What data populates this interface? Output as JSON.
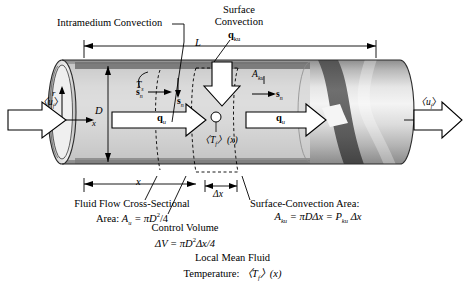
{
  "figure": {
    "colors": {
      "ink": "#000000",
      "tube_light": "#e9e9e9",
      "tube_mid": "#c8c8c8",
      "tube_dark": "#9a9a9a",
      "band_dark": "#6b6b6b",
      "band_light": "#f2f2f2",
      "rim": "#8f8f8f",
      "white": "#ffffff"
    },
    "annotations": {
      "intramedium_convection": "Intramedium Convection",
      "surface_convection_line1": "Surface",
      "surface_convection_line2": "Convection",
      "q_ku": "q",
      "q_ku_sub": "ku",
      "q_u": "q",
      "q_u_sub": "u",
      "s_n": "s",
      "s_n_sub": "n",
      "T_s": "T",
      "T_s_sub": "s",
      "A_ku": "A",
      "A_ku_sub": "ku",
      "length_L": "L",
      "diameter_D": "D",
      "axis_x": "x",
      "axis_r": "r",
      "dist_x": "x",
      "delta_x": "Δx",
      "inlet_velocity": "〈u",
      "inlet_velocity_sub": "f",
      "inlet_velocity_close": "〉",
      "outlet_velocity": "〈u",
      "outlet_velocity_sub": "f",
      "outlet_velocity_close": "〉",
      "mean_temp_inline": "〈T",
      "mean_temp_inline_sub": "f",
      "mean_temp_inline_tail": "〉(x)"
    },
    "captions": {
      "cross_section_line1": "Fluid Flow Cross-Sectional",
      "cross_section_line2_prefix": "Area: ",
      "cross_section_line2_A": "A",
      "cross_section_line2_Asub": "u",
      "cross_section_line2_eq": " = πD",
      "cross_section_line2_exp": "2",
      "cross_section_line2_tail": "/4",
      "control_volume_line1": "Control Volume",
      "control_volume_line2_prefix": "ΔV = πD",
      "control_volume_line2_exp": "2",
      "control_volume_line2_tail": "Δx/4",
      "surface_area_line1": "Surface-Convection Area:",
      "surface_area_A": "A",
      "surface_area_Asub": "ku",
      "surface_area_mid": " = πDΔx = P",
      "surface_area_Psub": "ku",
      "surface_area_tail": " Δx",
      "local_mean_line1": "Local Mean Fluid",
      "local_mean_line2_prefix": "Temperature: ",
      "local_mean_line2_T": "〈T",
      "local_mean_line2_Tsub": "f",
      "local_mean_line2_tail": "〉(x)"
    }
  }
}
